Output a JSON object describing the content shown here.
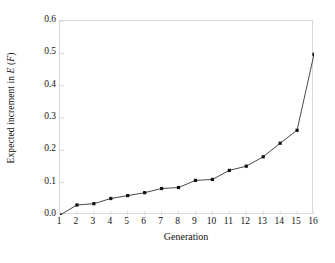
{
  "chart_data": {
    "type": "line",
    "title": "",
    "xlabel": "Generation",
    "ylabel": "Expected increment in E (F)",
    "ylabel_parts": {
      "prefix": "Expected increment in ",
      "symbol_e": "E",
      "open_paren": " (",
      "symbol_f": "F",
      "close_paren": ")"
    },
    "x": [
      1,
      2,
      3,
      4,
      5,
      6,
      7,
      8,
      9,
      10,
      11,
      12,
      13,
      14,
      15,
      16
    ],
    "values": [
      0.0,
      0.031,
      0.035,
      0.051,
      0.06,
      0.069,
      0.082,
      0.085,
      0.107,
      0.11,
      0.138,
      0.151,
      0.18,
      0.222,
      0.262,
      0.497
    ],
    "series": [
      {
        "name": "Expected increment in E (F)",
        "values": [
          0.0,
          0.031,
          0.035,
          0.051,
          0.06,
          0.069,
          0.082,
          0.085,
          0.107,
          0.11,
          0.138,
          0.151,
          0.18,
          0.222,
          0.262,
          0.497
        ]
      }
    ],
    "xlim": [
      1,
      16
    ],
    "ylim": [
      0.0,
      0.6
    ],
    "xticks": [
      "1",
      "2",
      "3",
      "4",
      "5",
      "6",
      "7",
      "8",
      "9",
      "10",
      "11",
      "12",
      "13",
      "14",
      "15",
      "16"
    ],
    "yticks": [
      "0.0",
      "0.1",
      "0.2",
      "0.3",
      "0.4",
      "0.5",
      "0.6"
    ],
    "ytick_values": [
      0.0,
      0.1,
      0.2,
      0.3,
      0.4,
      0.5,
      0.6
    ],
    "grid": false,
    "legend": "none",
    "marker": "square",
    "marker_color": "#111111",
    "line_color": "#333333",
    "frame_color": "#d8d8d8",
    "background": "#ffffff"
  }
}
